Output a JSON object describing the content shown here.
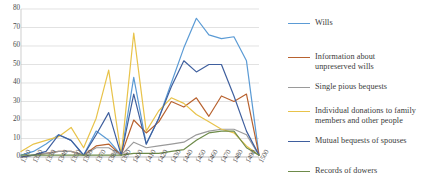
{
  "chart_data": {
    "type": "line",
    "title": "",
    "subtitle": "",
    "xlabel": "",
    "ylabel": "",
    "grid": true,
    "legend_position": "right",
    "ylim": [
      0,
      80
    ],
    "yticks": [
      0,
      10,
      20,
      30,
      40,
      50,
      60,
      70,
      80
    ],
    "ytick_labels": [
      "0",
      "10",
      "20",
      "30",
      "40",
      "50",
      "60",
      "70",
      "80"
    ],
    "categories": [
      "1310",
      "1320",
      "1330",
      "1340",
      "1350",
      "1360",
      "1370",
      "1380",
      "1390",
      "1400",
      "1410",
      "1420",
      "1430",
      "1440",
      "1450",
      "1460",
      "1470",
      "1480",
      "1490",
      "1500"
    ],
    "series": [
      {
        "name": "Wills",
        "color": "#5b9bd5",
        "values": [
          1,
          3,
          7,
          12,
          9,
          1,
          14,
          9,
          1,
          43,
          7,
          21,
          40,
          59,
          75,
          66,
          64,
          65,
          52,
          1
        ]
      },
      {
        "name": "Information about unpreserved wills",
        "color": "#b8622f",
        "values": [
          0,
          1,
          2,
          3,
          3,
          1,
          6,
          7,
          1,
          20,
          13,
          19,
          30,
          27,
          32,
          22,
          33,
          30,
          34,
          1
        ]
      },
      {
        "name": "Single pious bequests",
        "color": "#9a9a9a",
        "values": [
          0,
          1,
          2,
          3,
          3,
          1,
          5,
          5,
          1,
          8,
          5,
          6,
          7,
          8,
          12,
          14,
          15,
          15,
          12,
          1
        ]
      },
      {
        "name": "Individual donations to family members and other people",
        "color": "#e8c34a",
        "values": [
          3,
          7,
          9,
          11,
          16,
          5,
          21,
          47,
          1,
          67,
          14,
          25,
          32,
          29,
          23,
          19,
          15,
          13,
          6,
          1
        ]
      },
      {
        "name": "Mutual bequests of spouses",
        "color": "#3f5f9e",
        "values": [
          0,
          1,
          3,
          12,
          9,
          1,
          12,
          24,
          1,
          34,
          7,
          21,
          38,
          52,
          46,
          50,
          50,
          33,
          14,
          1
        ]
      },
      {
        "name": "Records of dowers",
        "color": "#6e8b4a",
        "values": [
          1,
          1,
          1,
          1,
          1,
          1,
          1,
          1,
          1,
          2,
          2,
          2,
          3,
          4,
          9,
          13,
          14,
          14,
          5,
          1
        ]
      }
    ]
  },
  "legend": {
    "items": [
      {
        "label": "Wills"
      },
      {
        "label": "Information about\nunpreserved wills"
      },
      {
        "label": "Single pious bequests"
      },
      {
        "label": "Individual donations to family\nmembers and other people"
      },
      {
        "label": "Mutual bequests of spouses"
      },
      {
        "label": "Records of dowers"
      }
    ]
  }
}
